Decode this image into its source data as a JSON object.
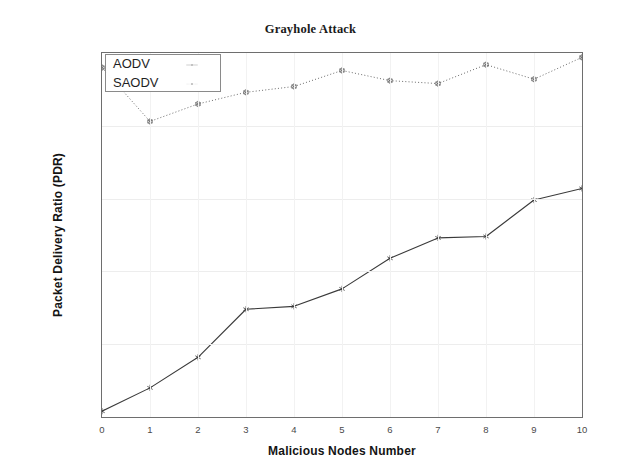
{
  "chart_data": {
    "type": "line",
    "title": "Grayhole Attack",
    "xlabel": "Malicious Nodes Number",
    "ylabel": "Packet Delivery Ratio (PDR)",
    "x": [
      0,
      1,
      2,
      3,
      4,
      5,
      6,
      7,
      8,
      9,
      10
    ],
    "xtick_labels": [
      "0",
      "1",
      "2",
      "3",
      "4",
      "5",
      "6",
      "7",
      "8",
      "9",
      "10"
    ],
    "ytick_labels": [
      "94",
      "94.5",
      "95",
      "95.5",
      "96",
      "96.5"
    ],
    "ytick_values": [
      94,
      94.5,
      95,
      95.5,
      96,
      96.5
    ],
    "xlim": [
      0,
      10
    ],
    "ylim": [
      94,
      96.5
    ],
    "grid": true,
    "legend_position": "top-left",
    "series": [
      {
        "name": "AODV",
        "style": "solid",
        "color": "#3a3a3a",
        "marker": "asterisk",
        "values": [
          94.04,
          94.2,
          94.41,
          94.74,
          94.76,
          94.88,
          95.09,
          95.23,
          95.24,
          95.49,
          95.57
        ]
      },
      {
        "name": "SAODV",
        "style": "dotted",
        "color": "#6b6b6b",
        "marker": "circle",
        "values": [
          96.4,
          96.03,
          96.15,
          96.23,
          96.27,
          96.38,
          96.31,
          96.29,
          96.42,
          96.32,
          96.47
        ]
      }
    ]
  },
  "legend": {
    "items": [
      {
        "label": "AODV",
        "style": "solid"
      },
      {
        "label": "SAODV",
        "style": "dotted"
      }
    ]
  },
  "colors": {
    "axis": "#6e6e6e",
    "grid": "#ededed",
    "text": "#141414",
    "tick_text": "#4a4a4a",
    "aodv": "#3a3a3a",
    "saodv": "#6b6b6b",
    "background": "#ffffff"
  }
}
